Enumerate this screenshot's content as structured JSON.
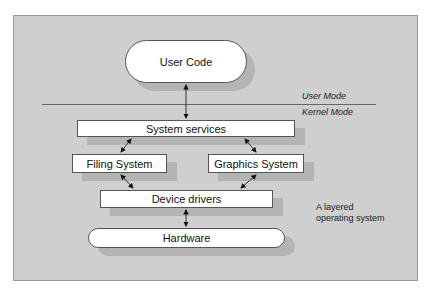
{
  "diagram": {
    "title": "A layered operating system",
    "caption_lines": [
      "A layered",
      "operating system"
    ],
    "mode_labels": {
      "user": "User Mode",
      "kernel": "Kernel Mode"
    },
    "nodes": {
      "user_code": "User Code",
      "system_services": "System services",
      "filing_system": "Filing System",
      "graphics_system": "Graphics System",
      "device_drivers": "Device drivers",
      "hardware": "Hardware"
    },
    "edges": [
      {
        "from": "User Code",
        "to": "System services",
        "type": "bidirectional"
      },
      {
        "from": "System services",
        "to": "Filing System",
        "type": "bidirectional"
      },
      {
        "from": "System services",
        "to": "Graphics System",
        "type": "bidirectional"
      },
      {
        "from": "Filing System",
        "to": "Device drivers",
        "type": "bidirectional"
      },
      {
        "from": "Graphics System",
        "to": "Device drivers",
        "type": "bidirectional"
      },
      {
        "from": "Device drivers",
        "to": "Hardware",
        "type": "bidirectional"
      }
    ],
    "colors": {
      "panel_background": "#cfcfcf",
      "box_fill": "#ffffff",
      "shadow": "#b4b4b4"
    }
  }
}
